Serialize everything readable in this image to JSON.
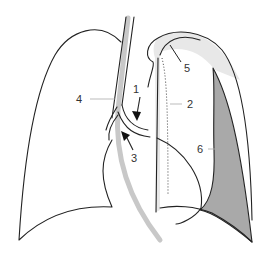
{
  "diagram": {
    "title": "",
    "labels": [
      {
        "id": "1",
        "text": "1",
        "x": 137,
        "y": 93
      },
      {
        "id": "2",
        "text": "2",
        "x": 191,
        "y": 107
      },
      {
        "id": "3",
        "text": "3",
        "x": 134,
        "y": 162
      },
      {
        "id": "4",
        "text": "4",
        "x": 77,
        "y": 103
      },
      {
        "id": "5",
        "text": "5",
        "x": 186,
        "y": 72
      },
      {
        "id": "6",
        "text": "6",
        "x": 199,
        "y": 153
      }
    ],
    "colors": {
      "outline": "#222222",
      "trachea_fill": "#c8c8c8",
      "light_band": "#e8e8e8",
      "dark_region": "#a9a9a9",
      "leader_line": "#aaaaaa",
      "background": "#ffffff"
    }
  }
}
